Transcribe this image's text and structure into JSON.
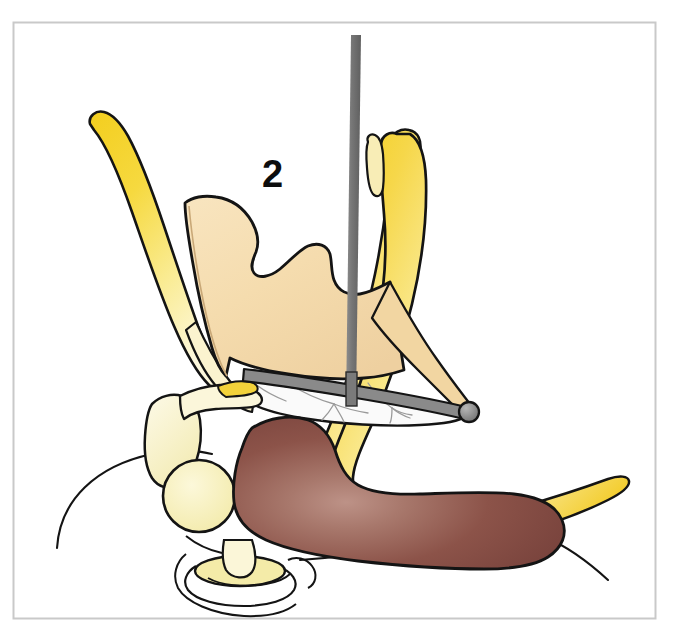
{
  "figure": {
    "kind": "anatomical-illustration",
    "background_color": "#ffffff",
    "frame": {
      "name": "illustration-border",
      "stroke_color": "#c9c9c9",
      "x": 13,
      "y": 22,
      "width": 643,
      "height": 597
    },
    "labels": [
      {
        "id": "callout-2",
        "text": "2",
        "x": 262,
        "y": 155,
        "color": "#0d0d0d",
        "font_size": 38,
        "bold": true
      }
    ],
    "palette": {
      "yellow_bright": "#F5D32A",
      "yellow_mid": "#F7DE66",
      "yellow_pale": "#FCF4CE",
      "peach_fill": "#F5DCAE",
      "peach_shade": "#E8C78C",
      "brown_dark": "#7B4138",
      "brown_mid": "#8E5248",
      "brown_light": "#B38275",
      "gray_instrument": "#7A7A7A",
      "gray_instrument_dark": "#5E5E5E",
      "outline_black": "#141414",
      "membrane_white": "#FAFAFA",
      "vessel_line": "#9a9a9a",
      "circle_pale": "#F7F0B8"
    },
    "structures": [
      {
        "id": "left-yellow-blade",
        "name": "left-lateral-bony-lamella",
        "color": "#F5D32A",
        "gradient_to": "#FCF4CE"
      },
      {
        "id": "right-yellow-band",
        "name": "right-lateral-bony-wall",
        "color": "#F5D32A",
        "gradient_to": "#FCF4CE"
      },
      {
        "id": "right-yellow-sliver",
        "name": "accessory-bony-spur",
        "color": "#F7E9A8"
      },
      {
        "id": "central-peach",
        "name": "middle-turbinate-body",
        "color": "#F5DCAE"
      },
      {
        "id": "membrane-sheet",
        "name": "translucent-mucosal-membrane",
        "color": "#FAFAFA"
      },
      {
        "id": "brown-turbinate",
        "name": "inferior-turbinate-mucosa",
        "color": "#8E5248"
      },
      {
        "id": "pale-circle",
        "name": "vessel-cross-section",
        "color": "#F7F0B8"
      },
      {
        "id": "pale-wedge",
        "name": "bony-process-wedge",
        "color": "#FBF6D6"
      },
      {
        "id": "gray-probe",
        "name": "surgical-probe-shaft",
        "color": "#7A7A7A"
      },
      {
        "id": "probe-tip",
        "name": "probe-ball-tip",
        "color": "#9a9a9a"
      },
      {
        "id": "base-ring",
        "name": "nasal-floor-ostium-ring",
        "color": "#F4EBA8"
      }
    ]
  }
}
